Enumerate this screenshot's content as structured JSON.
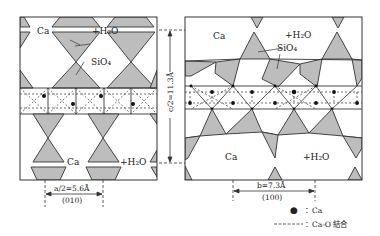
{
  "figure": {
    "colors": {
      "tetrahedron_fill": "#bdbdbd",
      "line": "#333333",
      "background": "#ffffff"
    }
  },
  "left_panel": {
    "projection": "(010)",
    "labels": {
      "ca_top": "Ca",
      "h2o_top": "+H₂O",
      "sio4": "SiO₄",
      "ca_bottom": "Ca",
      "h2o_bottom": "+H₂O"
    },
    "dimension": {
      "label": "a/2=5.6Å",
      "plane": "(010)"
    }
  },
  "right_panel": {
    "projection": "(100)",
    "labels": {
      "ca_top": "Ca",
      "h2o_top": "+H₂O",
      "sio4": "SiO₄",
      "ca_bottom": "Ca",
      "h2o_bottom": "+H₂O"
    },
    "dimension": {
      "label": "b=7.3Å",
      "plane": "(100)"
    }
  },
  "vertical_dimension": {
    "label": "c/2=11.3Å"
  },
  "legend": {
    "items": [
      {
        "symbol": "●",
        "label": "：Ca"
      },
      {
        "symbol": "------",
        "label": "：Ca-O 結合"
      }
    ]
  }
}
